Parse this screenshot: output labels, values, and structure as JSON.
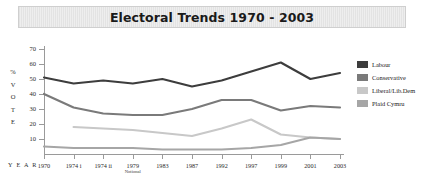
{
  "header": {
    "title": "Electoral Trends 1970 - 2003"
  },
  "axes": {
    "y_caption_letters": [
      "%",
      "V",
      "O",
      "T",
      "E"
    ],
    "y_caption": "% VOTE",
    "x_caption": "Y E A R",
    "y_ticks": [
      70,
      60,
      50,
      40,
      30,
      20,
      10
    ]
  },
  "legend": {
    "items": [
      {
        "label": "Labour",
        "color": "#3d3d3d"
      },
      {
        "label": "Conservative",
        "color": "#7a7a7a"
      },
      {
        "label": "Liberal/Lib.Dem",
        "color": "#c8c8c8"
      },
      {
        "label": "Plaid Cymru",
        "color": "#a6a6a6"
      }
    ]
  },
  "chart_data": {
    "type": "line",
    "title": "Electoral Trends 1970 - 2003",
    "xlabel": "YEAR",
    "ylabel": "% VOTE",
    "ylim": [
      0,
      70
    ],
    "yticks": [
      10,
      20,
      30,
      40,
      50,
      60,
      70
    ],
    "grid": false,
    "legend_position": "right",
    "categories": [
      "1970",
      "1974 i",
      "1974 ii",
      "1979",
      "1983",
      "1987",
      "1992",
      "1997",
      "1999",
      "2001",
      "2003"
    ],
    "category_sublabels": [
      "",
      "",
      "",
      "Notional",
      "",
      "",
      "",
      "",
      "",
      "",
      ""
    ],
    "series": [
      {
        "name": "Labour",
        "color": "#3d3d3d",
        "values": [
          51,
          47,
          49,
          47,
          50,
          45,
          49,
          55,
          61,
          50,
          54
        ]
      },
      {
        "name": "Conservative",
        "color": "#7a7a7a",
        "values": [
          40,
          31,
          27,
          26,
          26,
          30,
          36,
          36,
          29,
          32,
          31
        ]
      },
      {
        "name": "Liberal/Lib.Dem",
        "color": "#c8c8c8",
        "values": [
          null,
          18,
          17,
          16,
          14,
          12,
          17,
          23,
          13,
          11,
          10
        ]
      },
      {
        "name": "Plaid Cymru",
        "color": "#a6a6a6",
        "values": [
          5,
          4,
          4,
          4,
          3,
          3,
          3,
          4,
          6,
          11,
          10
        ]
      }
    ]
  }
}
